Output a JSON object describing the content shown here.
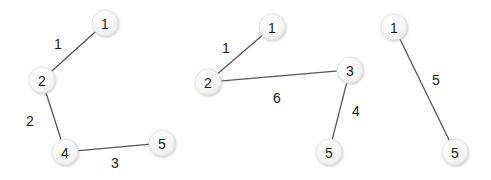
{
  "figure": {
    "width": 491,
    "height": 180,
    "background_color": "#ffffff",
    "node_fill_color": "#f4f4f4",
    "node_stroke_color": "#e2e2e2",
    "edge_color": "#555555",
    "text_color": "#1a1a1a"
  },
  "chart_data": {
    "type": "diagram",
    "title": "",
    "xlabel": "",
    "ylabel": "",
    "graphs": [
      {
        "id": "graph-left",
        "nodes": [
          {
            "id": "1",
            "label": "1",
            "x": 105,
            "y": 23,
            "r": 13
          },
          {
            "id": "2",
            "label": "2",
            "x": 42,
            "y": 80,
            "r": 13
          },
          {
            "id": "4",
            "label": "4",
            "x": 65,
            "y": 152,
            "r": 13
          },
          {
            "id": "5",
            "label": "5",
            "x": 162,
            "y": 143,
            "r": 13
          }
        ],
        "edges": [
          {
            "source": "2",
            "target": "1",
            "weight": "1",
            "label_x": 58,
            "label_y": 44
          },
          {
            "source": "2",
            "target": "4",
            "weight": "2",
            "label_x": 30,
            "label_y": 121
          },
          {
            "source": "4",
            "target": "5",
            "weight": "3",
            "label_x": 115,
            "label_y": 163
          }
        ]
      },
      {
        "id": "graph-middle",
        "nodes": [
          {
            "id": "1",
            "label": "1",
            "x": 272,
            "y": 27,
            "r": 13
          },
          {
            "id": "2",
            "label": "2",
            "x": 208,
            "y": 82,
            "r": 13
          },
          {
            "id": "3",
            "label": "3",
            "x": 350,
            "y": 70,
            "r": 13
          },
          {
            "id": "5",
            "label": "5",
            "x": 329,
            "y": 152,
            "r": 13
          }
        ],
        "edges": [
          {
            "source": "2",
            "target": "1",
            "weight": "1",
            "label_x": 226,
            "label_y": 48
          },
          {
            "source": "2",
            "target": "3",
            "weight": "6",
            "label_x": 277,
            "label_y": 98
          },
          {
            "source": "3",
            "target": "5",
            "weight": "4",
            "label_x": 356,
            "label_y": 111
          }
        ]
      },
      {
        "id": "graph-right",
        "nodes": [
          {
            "id": "1",
            "label": "1",
            "x": 394,
            "y": 27,
            "r": 13
          },
          {
            "id": "5",
            "label": "5",
            "x": 455,
            "y": 152,
            "r": 13
          }
        ],
        "edges": [
          {
            "source": "1",
            "target": "5",
            "weight": "5",
            "label_x": 436,
            "label_y": 80
          }
        ]
      }
    ]
  }
}
